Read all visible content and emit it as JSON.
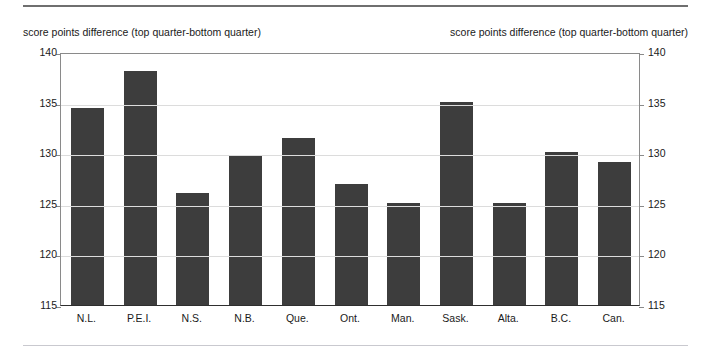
{
  "rules": {
    "top": "solid-rule",
    "bottom": "solid-rule-faint"
  },
  "axis_captions": {
    "left": "score points difference (top quarter-bottom quarter)",
    "right": "score points difference (top quarter-bottom quarter)"
  },
  "colors": {
    "bar": "#3d3d3d",
    "grid": "#dcdcdc",
    "frame": "#8a8a8a",
    "baseline": "#2f2f2f",
    "text": "#1a1a1a",
    "top_rule": "#6f6f6f"
  },
  "chart_data": {
    "type": "bar",
    "title": "",
    "subtitle": "",
    "xlabel": "",
    "ylabel": "score points difference (top quarter-bottom quarter)",
    "ylabel_right": "score points difference (top quarter-bottom quarter)",
    "ylim": [
      115,
      140
    ],
    "yticks": [
      115,
      120,
      125,
      130,
      135,
      140
    ],
    "ytick_labels": [
      "115",
      "120",
      "125",
      "130",
      "135",
      "140"
    ],
    "grid": true,
    "legend": null,
    "categories": [
      "N.L.",
      "P.E.I.",
      "N.S.",
      "N.B.",
      "Que.",
      "Ont.",
      "Man.",
      "Sask.",
      "Alta.",
      "B.C.",
      "Can."
    ],
    "values": [
      134.5,
      138.1,
      126.1,
      129.7,
      131.5,
      127.0,
      125.1,
      135.1,
      125.1,
      130.1,
      129.1
    ],
    "series": [
      {
        "name": "score points difference",
        "values": [
          134.5,
          138.1,
          126.1,
          129.7,
          131.5,
          127.0,
          125.1,
          135.1,
          125.1,
          130.1,
          129.1
        ]
      }
    ]
  }
}
